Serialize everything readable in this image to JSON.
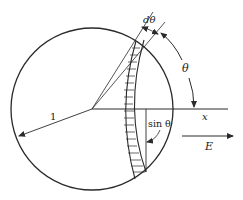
{
  "diagram": {
    "labels": {
      "d_theta": "dθ",
      "theta": "θ",
      "radius": "1",
      "x_axis": "x",
      "sin_theta": "sin θ",
      "field": "E"
    },
    "colors": {
      "stroke": "#2a2a2a",
      "background": "#ffffff"
    }
  }
}
